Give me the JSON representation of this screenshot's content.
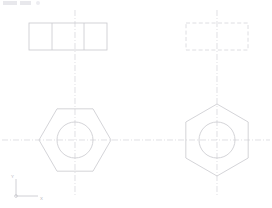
{
  "app": {
    "title": "CAD Orthographic Drawing",
    "background_color": "#ffffff",
    "line_color": "#c9c9ce",
    "hidden_line_color": "#d6d6da",
    "center_line_color": "#d2d2d8",
    "axis_color": "#c4c4ca",
    "toolbar_chip_color": "#e8e8ec"
  },
  "toolbar": {
    "chip_1_label": "",
    "chip_2_label": "",
    "chip_3_label": ""
  },
  "ucs": {
    "name": "ucs-axis-indicator",
    "origin_x": 16,
    "origin_y": 196,
    "y_label": "Y",
    "x_label": "X",
    "y_label_x": 11,
    "y_label_y": 178,
    "x_label_x": 40,
    "x_label_y": 200,
    "y_arm_length": 17,
    "x_arm_length": 22
  },
  "views": {
    "top_left": {
      "name": "front-view-across-flats",
      "shape": "rectangle",
      "line_style": "solid",
      "x": 29,
      "y": 23,
      "width": 78,
      "height": 27,
      "divider_offsets": [
        23,
        55
      ],
      "divider_count": 2
    },
    "top_right": {
      "name": "front-view-across-corners-hidden",
      "shape": "rectangle",
      "line_style": "dashed",
      "x": 186,
      "y": 23,
      "width": 62,
      "height": 27,
      "divider_offsets": [],
      "divider_count": 0
    },
    "bottom_left": {
      "name": "plan-view-hexagon-flat-top",
      "shape": "hexagon",
      "orientation": "flat-top",
      "line_style": "solid",
      "center_x": 75,
      "center_y": 140,
      "radius": 36,
      "circle_radius": 18
    },
    "bottom_right": {
      "name": "plan-view-hexagon-pointy-top",
      "shape": "hexagon",
      "orientation": "pointy-top",
      "line_style": "solid",
      "center_x": 217,
      "center_y": 140,
      "radius": 36,
      "circle_radius": 18
    }
  },
  "center_lines": {
    "horizontal_main": {
      "name": "horizontal-centerline",
      "x1": 2,
      "y1": 140,
      "x2": 270,
      "y2": 140
    },
    "vertical_left": {
      "name": "vertical-centerline-left",
      "x1": 75,
      "y1": 10,
      "x2": 75,
      "y2": 196
    },
    "vertical_right": {
      "name": "vertical-centerline-right",
      "x1": 217,
      "y1": 10,
      "x2": 217,
      "y2": 196
    },
    "dash_pattern": "6 2 1 2"
  }
}
